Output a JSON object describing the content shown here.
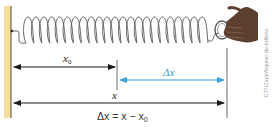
{
  "figure": {
    "type": "physics-diagram",
    "labels": {
      "x0_main": "x",
      "x0_sub": "0",
      "dx": "Δx",
      "x": "x"
    },
    "equation": {
      "lhs": "Δx = x − x",
      "sub": "0"
    },
    "credit": "CJT/Zapt/Arquivo da editora",
    "colors": {
      "wall": "#f2dfa0",
      "wall_edge": "#5a4a2a",
      "spring": "#555555",
      "arrow_black": "#1a1a1a",
      "arrow_blue": "#3a9fd6",
      "hand": "#5b4030",
      "guide_line": "#444444"
    },
    "arrows": [
      {
        "name": "x0",
        "from": 13,
        "to": 116,
        "y": 67,
        "color": "black",
        "double": true
      },
      {
        "name": "delta-x",
        "from": 119,
        "to": 225,
        "y": 80,
        "color": "blue",
        "double": true
      },
      {
        "name": "x",
        "from": 13,
        "to": 225,
        "y": 103,
        "color": "black",
        "double": true
      }
    ]
  }
}
